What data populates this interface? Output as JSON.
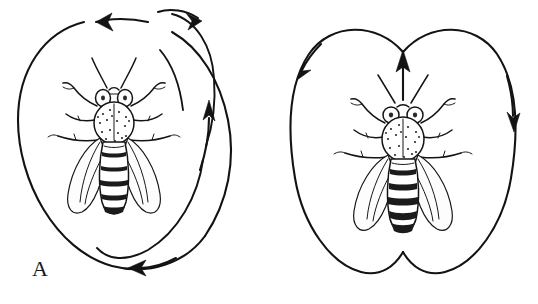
{
  "figure": {
    "background_color": "#ffffff",
    "ink_color": "#131313",
    "width": 538,
    "height": 304
  },
  "panels": [
    {
      "id": "panel-a",
      "label": "A",
      "dance_name": "round dance",
      "subject": "honeybee",
      "description": "Honeybee shown from above inside overlapping circular loops traced by the dancing bee.",
      "path_shape": "overlapping circles",
      "loop_count": 2,
      "arrow_count": 3,
      "arrows": [
        {
          "name": "top-left-arrow",
          "direction": "left",
          "position": "top-left of outer circle"
        },
        {
          "name": "top-right-arrow",
          "direction": "right",
          "position": "top-right, inner loop"
        },
        {
          "name": "right-arrow",
          "direction": "up",
          "position": "right side, inner loop"
        },
        {
          "name": "bottom-arrow",
          "direction": "left",
          "position": "bottom of inner loop"
        }
      ]
    },
    {
      "id": "panel-b",
      "label": "B",
      "dance_name": "waggle dance",
      "subject": "honeybee",
      "description": "Honeybee shown from above inside a figure-eight path with a straight central waggle run marked by an upward arrow.",
      "path_shape": "figure eight",
      "loop_count": 2,
      "arrow_count": 3,
      "arrows": [
        {
          "name": "left-loop-arrow",
          "direction": "down-left",
          "position": "upper left loop"
        },
        {
          "name": "right-loop-arrow",
          "direction": "down",
          "position": "upper right loop"
        },
        {
          "name": "waggle-run-arrow",
          "direction": "up",
          "position": "center, between loops"
        }
      ]
    }
  ],
  "bee_anatomy": {
    "parts": [
      "antennae",
      "compound eyes",
      "head",
      "thorax",
      "abdomen",
      "forewings",
      "hindwings",
      "legs"
    ],
    "leg_count": 6,
    "wing_count": 4,
    "antenna_count": 2,
    "abdomen_band_count": 5
  }
}
